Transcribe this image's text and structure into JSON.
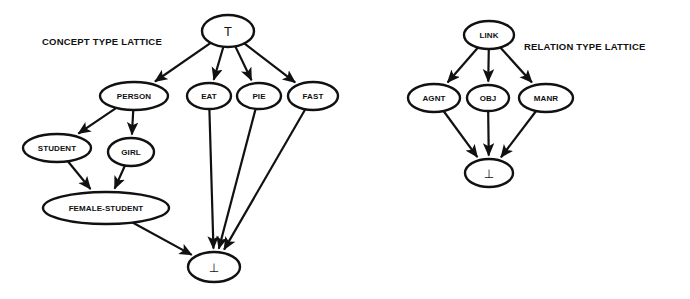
{
  "figure": {
    "background_color": "#ffffff",
    "ink_color": "#111111",
    "width": 690,
    "height": 299
  },
  "captions": [
    {
      "id": "concept-caption",
      "text": "CONCEPT TYPE LATTICE",
      "x": 42,
      "y": 45,
      "font_size": 9.5
    },
    {
      "id": "relation-caption",
      "text": "RELATION TYPE LATTICE",
      "x": 524,
      "y": 50,
      "font_size": 9.5
    }
  ],
  "lattices": [
    {
      "id": "concept-type-lattice",
      "name": "CONCEPT TYPE LATTICE",
      "nodes": [
        {
          "id": "top",
          "label": "T",
          "symbol": true,
          "x": 228,
          "y": 31,
          "rx": 26,
          "ry": 16,
          "font_size": 12
        },
        {
          "id": "person",
          "label": "PERSON",
          "x": 134,
          "y": 96,
          "rx": 34,
          "ry": 14,
          "font_size": 8
        },
        {
          "id": "eat",
          "label": "EAT",
          "x": 209,
          "y": 96,
          "rx": 22,
          "ry": 13,
          "font_size": 8
        },
        {
          "id": "pie",
          "label": "PIE",
          "x": 259,
          "y": 96,
          "rx": 22,
          "ry": 13,
          "font_size": 8
        },
        {
          "id": "fast",
          "label": "FAST",
          "x": 313,
          "y": 96,
          "rx": 25,
          "ry": 14,
          "font_size": 8
        },
        {
          "id": "student",
          "label": "STUDENT",
          "x": 57,
          "y": 148,
          "rx": 34,
          "ry": 14,
          "font_size": 8
        },
        {
          "id": "girl",
          "label": "GIRL",
          "x": 131,
          "y": 152,
          "rx": 23,
          "ry": 14,
          "font_size": 8
        },
        {
          "id": "female-student",
          "label": "FEMALE-STUDENT",
          "x": 106,
          "y": 208,
          "rx": 63,
          "ry": 16,
          "font_size": 8
        },
        {
          "id": "bottom",
          "label": "⊥",
          "symbol": true,
          "x": 214,
          "y": 267,
          "rx": 26,
          "ry": 15,
          "font_size": 12
        }
      ],
      "edges": [
        {
          "from": "top",
          "to": "person"
        },
        {
          "from": "top",
          "to": "eat"
        },
        {
          "from": "top",
          "to": "pie"
        },
        {
          "from": "top",
          "to": "fast"
        },
        {
          "from": "person",
          "to": "student"
        },
        {
          "from": "person",
          "to": "girl"
        },
        {
          "from": "student",
          "to": "female-student"
        },
        {
          "from": "girl",
          "to": "female-student"
        },
        {
          "from": "female-student",
          "to": "bottom"
        },
        {
          "from": "eat",
          "to": "bottom"
        },
        {
          "from": "pie",
          "to": "bottom"
        },
        {
          "from": "fast",
          "to": "bottom"
        }
      ]
    },
    {
      "id": "relation-type-lattice",
      "name": "RELATION TYPE LATTICE",
      "nodes": [
        {
          "id": "link",
          "label": "LINK",
          "x": 489,
          "y": 35,
          "rx": 25,
          "ry": 14,
          "font_size": 8
        },
        {
          "id": "agnt",
          "label": "AGNT",
          "x": 434,
          "y": 98,
          "rx": 26,
          "ry": 14,
          "font_size": 8
        },
        {
          "id": "obj",
          "label": "OBJ",
          "x": 488,
          "y": 98,
          "rx": 21,
          "ry": 13,
          "font_size": 8
        },
        {
          "id": "manr",
          "label": "MANR",
          "x": 546,
          "y": 98,
          "rx": 27,
          "ry": 14,
          "font_size": 8
        },
        {
          "id": "rbottom",
          "label": "⊥",
          "symbol": true,
          "x": 489,
          "y": 173,
          "rx": 24,
          "ry": 14,
          "font_size": 12
        }
      ],
      "edges": [
        {
          "from": "link",
          "to": "agnt"
        },
        {
          "from": "link",
          "to": "obj"
        },
        {
          "from": "link",
          "to": "manr"
        },
        {
          "from": "agnt",
          "to": "rbottom"
        },
        {
          "from": "obj",
          "to": "rbottom"
        },
        {
          "from": "manr",
          "to": "rbottom"
        }
      ]
    }
  ]
}
